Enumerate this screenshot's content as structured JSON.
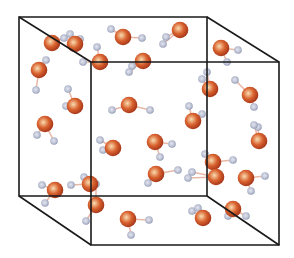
{
  "diagram": {
    "colors": {
      "background": "#ffffff",
      "edge": "#1a1a1a",
      "oxygen_center": "#f8dcb0",
      "oxygen_mid": "#d9622f",
      "oxygen_rim": "#a8381a",
      "hydrogen_center": "#d6d9e6",
      "hydrogen_rim": "#8a92ad",
      "bond": "#e8b9a8"
    },
    "cube": {
      "back_face": [
        [
          19,
          17
        ],
        [
          207,
          17
        ],
        [
          207,
          196
        ],
        [
          19,
          196
        ]
      ],
      "front_face": [
        [
          91,
          62
        ],
        [
          279,
          62
        ],
        [
          279,
          245
        ],
        [
          91,
          245
        ]
      ]
    },
    "molecules": [
      {
        "o": [
          52,
          43
        ],
        "h": [
          [
            64,
            38
          ],
          [
            70,
            34
          ]
        ]
      },
      {
        "o": [
          39,
          70
        ],
        "h": [
          [
            46,
            60
          ],
          [
            36,
            90
          ]
        ]
      },
      {
        "o": [
          123,
          37
        ],
        "h": [
          [
            111,
            29
          ],
          [
            142,
            38
          ]
        ]
      },
      {
        "o": [
          180,
          30
        ],
        "h": [
          [
            166,
            37
          ],
          [
            163,
            44
          ]
        ]
      },
      {
        "o": [
          221,
          48
        ],
        "h": [
          [
            238,
            50
          ],
          [
            227,
            62
          ]
        ]
      },
      {
        "o": [
          100,
          62
        ],
        "h": [
          [
            97,
            47
          ],
          [
            83,
            62
          ]
        ]
      },
      {
        "o": [
          143,
          61
        ],
        "h": [
          [
            132,
            66
          ],
          [
            129,
            72
          ]
        ]
      },
      {
        "o": [
          75,
          106
        ],
        "h": [
          [
            68,
            89
          ],
          [
            66,
            106
          ]
        ]
      },
      {
        "o": [
          45,
          124
        ],
        "h": [
          [
            37,
            135
          ],
          [
            54,
            141
          ]
        ]
      },
      {
        "o": [
          129,
          105
        ],
        "h": [
          [
            112,
            110
          ],
          [
            150,
            110
          ]
        ]
      },
      {
        "o": [
          210,
          89
        ],
        "h": [
          [
            207,
            72
          ],
          [
            202,
            79
          ]
        ]
      },
      {
        "o": [
          250,
          95
        ],
        "h": [
          [
            254,
            107
          ],
          [
            235,
            80
          ]
        ]
      },
      {
        "o": [
          113,
          148
        ],
        "h": [
          [
            100,
            140
          ],
          [
            103,
            150
          ]
        ]
      },
      {
        "o": [
          193,
          121
        ],
        "h": [
          [
            189,
            106
          ],
          [
            202,
            114
          ]
        ]
      },
      {
        "o": [
          155,
          142
        ],
        "h": [
          [
            172,
            144
          ],
          [
            160,
            157
          ]
        ]
      },
      {
        "o": [
          213,
          162
        ],
        "h": [
          [
            233,
            160
          ],
          [
            205,
            154
          ]
        ]
      },
      {
        "o": [
          259,
          141
        ],
        "h": [
          [
            258,
            127
          ],
          [
            254,
            125
          ]
        ]
      },
      {
        "o": [
          156,
          174
        ],
        "h": [
          [
            148,
            183
          ],
          [
            178,
            170
          ]
        ]
      },
      {
        "o": [
          216,
          177
        ],
        "h": [
          [
            192,
            172
          ],
          [
            188,
            178
          ]
        ]
      },
      {
        "o": [
          246,
          178
        ],
        "h": [
          [
            265,
            176
          ],
          [
            251,
            191
          ]
        ]
      },
      {
        "o": [
          90,
          184
        ],
        "h": [
          [
            84,
            177
          ],
          [
            71,
            185
          ]
        ]
      },
      {
        "o": [
          55,
          190
        ],
        "h": [
          [
            42,
            185
          ],
          [
            45,
            203
          ]
        ]
      },
      {
        "o": [
          96,
          205
        ],
        "h": [
          [
            96,
            184
          ],
          [
            86,
            221
          ]
        ]
      },
      {
        "o": [
          128,
          219
        ],
        "h": [
          [
            149,
            220
          ],
          [
            131,
            235
          ]
        ]
      },
      {
        "o": [
          203,
          218
        ],
        "h": [
          [
            192,
            211
          ],
          [
            198,
            208
          ]
        ]
      },
      {
        "o": [
          233,
          209
        ],
        "h": [
          [
            246,
            216
          ],
          [
            228,
            216
          ]
        ]
      },
      {
        "o": [
          75,
          44
        ],
        "h": [
          [
            80,
            39
          ],
          [
            76,
            46
          ]
        ]
      }
    ]
  }
}
